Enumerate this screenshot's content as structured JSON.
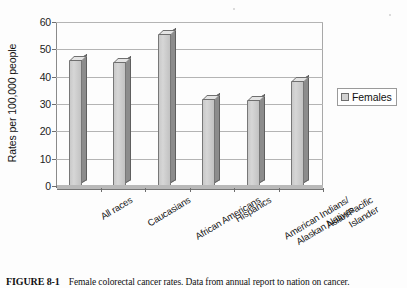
{
  "figure": {
    "caption_number": "FIGURE 8-1",
    "caption_text": "Female colorectal cancer rates. Data from annual report to nation on cancer."
  },
  "legend": {
    "position": "right",
    "entries": [
      {
        "label": "Females",
        "swatch_color": "#d2d2d2",
        "icon": "legend-swatch-icon"
      }
    ]
  },
  "axes": {
    "y_title": "Rates per 100,000 people",
    "y_ticks": [
      "0",
      "10",
      "20",
      "30",
      "40",
      "50",
      "60"
    ],
    "x_ticks": [
      "All races",
      "Caucasians",
      "African Americans",
      "Hispanics",
      "American Indians/\nAlaskan Natives",
      "Asian/Pacific Islander"
    ]
  },
  "chart_data": {
    "type": "bar",
    "title": "",
    "subtitle": "",
    "xlabel": "",
    "ylabel": "Rates per 100,000 people",
    "categories": [
      "All races",
      "Caucasians",
      "African Americans",
      "Hispanics",
      "American Indians/Alaskan Natives",
      "Asian/Pacific Islander"
    ],
    "series": [
      {
        "name": "Females",
        "values": [
          46,
          45.5,
          55.5,
          32,
          31.5,
          38.5
        ],
        "color": "#d2d2d2"
      }
    ],
    "ylim": [
      0,
      60
    ],
    "ytick_interval": 10,
    "grid": true,
    "grid_axis": "y",
    "legend_position": "right",
    "style": "3d-column",
    "annotations": []
  }
}
